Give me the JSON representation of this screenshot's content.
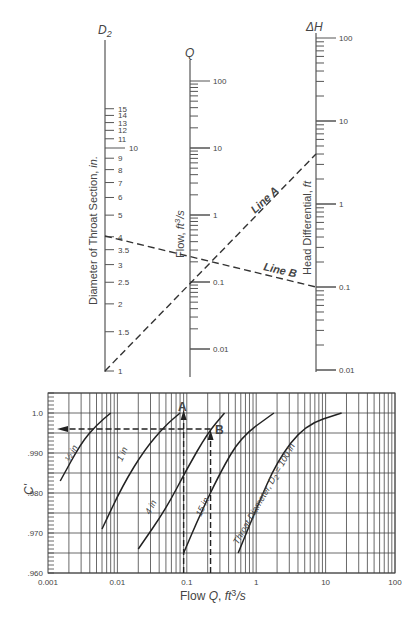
{
  "chart_data": [
    {
      "type": "nomograph",
      "title": "Venturi meter flow nomograph",
      "axes": [
        {
          "id": "D2",
          "symbol": "D2",
          "label": "Diameter of Throat Section, in.",
          "scale": "log",
          "ticks": [
            "1",
            "1.5",
            "2",
            "2.5",
            "3",
            "3.5",
            "4",
            "5",
            "6",
            "7",
            "8",
            "9",
            "10",
            "11",
            "12",
            "13",
            "14",
            "15"
          ]
        },
        {
          "id": "Q",
          "symbol": "Q",
          "label": "Flow, ft3/s",
          "scale": "log",
          "ticks": [
            "0.01",
            "0.1",
            "1",
            "10",
            "100"
          ]
        },
        {
          "id": "dH",
          "symbol": "ΔH",
          "label": "Head Differential, ft",
          "scale": "log",
          "ticks": [
            "0.01",
            "0.1",
            "1",
            "10",
            "100"
          ]
        }
      ],
      "lines": [
        {
          "name": "Line A",
          "D2": 1,
          "Q": 0.09,
          "dH": 4.0
        },
        {
          "name": "Line B",
          "D2": 4,
          "Q": 0.22,
          "dH": 0.1
        }
      ]
    },
    {
      "type": "line",
      "title": "",
      "xlabel": "Flow Q, ft3/s",
      "ylabel": "C'",
      "xscale": "log",
      "xlim": [
        0.001,
        100
      ],
      "ylim": [
        0.96,
        1.005
      ],
      "xticks": [
        "0.001",
        "0.01",
        "0.1",
        "1",
        "10",
        "100"
      ],
      "yticks": [
        ".960",
        ".970",
        ".980",
        ".990",
        "1.0"
      ],
      "grid": true,
      "series": [
        {
          "name": "½ in",
          "x": [
            0.0015,
            0.003,
            0.005,
            0.008
          ],
          "y": [
            0.983,
            0.9925,
            0.997,
            1.0
          ]
        },
        {
          "name": "1 in",
          "x": [
            0.006,
            0.012,
            0.025,
            0.05,
            0.08
          ],
          "y": [
            0.971,
            0.982,
            0.991,
            0.997,
            1.0
          ]
        },
        {
          "name": "4 in",
          "x": [
            0.02,
            0.05,
            0.1,
            0.2,
            0.35
          ],
          "y": [
            0.966,
            0.976,
            0.986,
            0.995,
            1.0
          ]
        },
        {
          "name": "15 in",
          "x": [
            0.09,
            0.15,
            0.3,
            0.6,
            1.8
          ],
          "y": [
            0.965,
            0.974,
            0.985,
            0.994,
            1.0
          ]
        },
        {
          "name": "Throat Diameter, D2 = 100 in",
          "x": [
            0.55,
            1,
            2,
            5,
            17
          ],
          "y": [
            0.965,
            0.976,
            0.988,
            0.997,
            1.0
          ]
        }
      ],
      "annotations": [
        {
          "label": "A",
          "x": 0.09,
          "arrow": "up"
        },
        {
          "label": "B",
          "x": 0.22,
          "arrow": "up"
        },
        {
          "label": "",
          "y": 0.996,
          "arrow": "left",
          "from_x": 0.22,
          "to_x": 0.0015
        }
      ]
    }
  ],
  "nomo": {
    "d2_symbol": "D",
    "d2_sub": "2",
    "d2_label": "Diameter of Throat Section, ",
    "d2_unit": "in.",
    "q_symbol": "Q",
    "q_label": "Flow, ",
    "q_unit": "ft3/s",
    "dh_symbol": "ΔH",
    "dh_label": "Head Differential, ",
    "dh_unit": "ft",
    "line_a": "Line A",
    "line_b": "Line B"
  },
  "plot": {
    "ylabel": "C'",
    "xlabel_pre": "Flow ",
    "xlabel_q": "Q",
    "xlabel_unit": ", ft3/s",
    "label_a": "A",
    "label_b": "B",
    "curve_half": "½ in",
    "curve_1": "1 in",
    "curve_4": "4 in",
    "curve_15": "15 in",
    "curve_100": "Throat Diameter, D2 = 100 in"
  }
}
